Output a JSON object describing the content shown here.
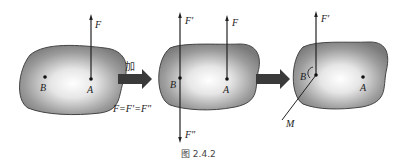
{
  "figure": {
    "caption": "图 2.4.2",
    "panels": [
      {
        "id": "panel-1",
        "points": [
          {
            "label": "B"
          },
          {
            "label": "A"
          }
        ],
        "forces": [
          {
            "label": "F",
            "at": "A",
            "direction": "up"
          }
        ]
      },
      {
        "id": "panel-2",
        "points": [
          {
            "label": "B"
          },
          {
            "label": "A"
          }
        ],
        "forces": [
          {
            "label": "F′",
            "at": "B",
            "direction": "up"
          },
          {
            "label": "F",
            "at": "A",
            "direction": "up"
          },
          {
            "label": "F″",
            "at": "B",
            "direction": "down"
          }
        ]
      },
      {
        "id": "panel-3",
        "points": [
          {
            "label": "B"
          },
          {
            "label": "A"
          }
        ],
        "forces": [
          {
            "label": "F′",
            "at": "B",
            "direction": "up"
          }
        ],
        "moment": {
          "label": "M",
          "at": "B"
        }
      }
    ],
    "transition_1": {
      "label": "加",
      "equation": "F=F′=F″"
    },
    "transition_2": {
      "label": ""
    }
  }
}
